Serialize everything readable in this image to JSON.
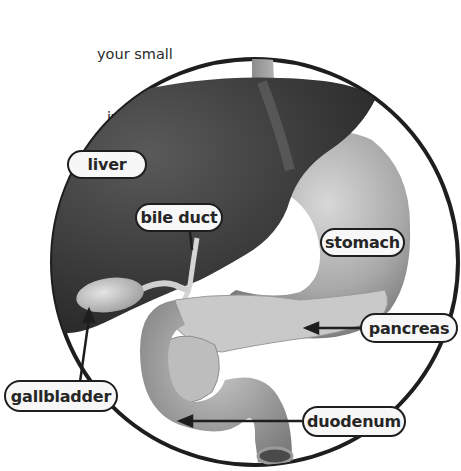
{
  "figure": {
    "background": "#ffffff",
    "circle_stroke": "#1e1e1e"
  },
  "body_text_fragments": {
    "lines": [
      "your small",
      "ive process.",
      "d by your",
      "arge",
      "ter",
      "d"
    ]
  },
  "labels": {
    "liver": "liver",
    "bile_duct": "bile duct",
    "stomach": "stomach",
    "pancreas": "pancreas",
    "gallbladder": "gallbladder",
    "duodenum": "duodenum"
  }
}
